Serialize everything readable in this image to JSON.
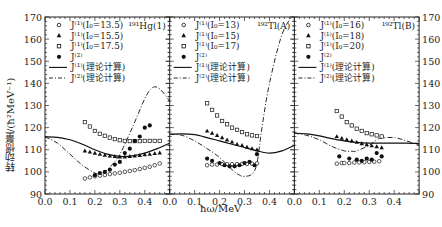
{
  "chart_data": {
    "type": "scatter",
    "ylabel": "转动惯量/(ħ²MeV⁻¹)",
    "xlabel": "ħω/MeV",
    "ylim": [
      90,
      170
    ],
    "yticks": [
      90,
      100,
      110,
      120,
      130,
      140,
      150,
      160,
      170
    ],
    "xlim": [
      0.0,
      0.5
    ],
    "xticks": [
      "0.0",
      "0.1",
      "0.2",
      "0.3",
      "0.4"
    ],
    "panels": [
      {
        "nucleus": "¹⁹¹Hg(1)",
        "legend": [
          "J⁽¹⁾(I₀=13.5)",
          "J⁽¹⁾(I₀=15.5)",
          "J⁽¹⁾(I₀=17.5)",
          "J⁽²⁾",
          "J⁽¹⁾(理论计算)",
          "J⁽²⁾(理论计算)"
        ],
        "series": [
          {
            "name": "J(1) I0=13.5",
            "marker": "open-circle",
            "x": [
              0.16,
              0.18,
              0.2,
              0.22,
              0.24,
              0.26,
              0.28,
              0.3,
              0.32,
              0.34,
              0.36,
              0.38,
              0.4,
              0.42,
              0.44,
              0.46
            ],
            "y": [
              97,
              97.5,
              98,
              98.3,
              98.6,
              99,
              99.3,
              99.6,
              100,
              100.4,
              100.8,
              101.3,
              101.8,
              102.3,
              103,
              103.8
            ]
          },
          {
            "name": "J(1) I0=15.5",
            "marker": "filled-triangle",
            "x": [
              0.16,
              0.18,
              0.2,
              0.22,
              0.24,
              0.26,
              0.28,
              0.3,
              0.32,
              0.34,
              0.36,
              0.38,
              0.4,
              0.42,
              0.44,
              0.46
            ],
            "y": [
              109.5,
              109,
              108.5,
              108,
              107.6,
              107.2,
              107,
              106.8,
              106.8,
              107,
              107.2,
              107.5,
              107.8,
              108,
              108.3,
              108.6
            ]
          },
          {
            "name": "J(1) I0=17.5",
            "marker": "open-square",
            "x": [
              0.16,
              0.18,
              0.2,
              0.22,
              0.24,
              0.26,
              0.28,
              0.3,
              0.32,
              0.34,
              0.36,
              0.38,
              0.4,
              0.42,
              0.44,
              0.46
            ],
            "y": [
              122.5,
              120.5,
              118.5,
              117.2,
              116.3,
              115.5,
              114.8,
              114.3,
              114,
              113.9,
              113.9,
              113.9,
              114,
              114,
              114,
              114
            ]
          },
          {
            "name": "J(2)",
            "marker": "filled-circle",
            "x": [
              0.2,
              0.22,
              0.24,
              0.26,
              0.28,
              0.3,
              0.32,
              0.34,
              0.36,
              0.38,
              0.4,
              0.42
            ],
            "y": [
              98.5,
              99.5,
              100,
              101,
              103.3,
              104.5,
              108.5,
              110.5,
              114,
              116,
              120,
              121
            ]
          }
        ],
        "theory_J1": {
          "x": [
            0.0,
            0.05,
            0.1,
            0.15,
            0.2,
            0.25,
            0.3,
            0.35,
            0.4,
            0.45,
            0.5
          ],
          "y": [
            115.8,
            115.6,
            114.5,
            112.5,
            110,
            108,
            107,
            107.2,
            108.5,
            110.5,
            113
          ]
        },
        "theory_J2": {
          "x": [
            0.0,
            0.05,
            0.1,
            0.15,
            0.2,
            0.22,
            0.25,
            0.3,
            0.35,
            0.4,
            0.43,
            0.46,
            0.5
          ],
          "y": [
            115.8,
            113,
            108,
            103,
            99.5,
            99.3,
            101,
            108,
            120,
            133,
            138,
            137.5,
            132
          ]
        }
      },
      {
        "nucleus": "¹⁹²Tl(A)",
        "legend": [
          "J⁽¹⁾(I₀=13)",
          "J⁽¹⁾(I₀=15)",
          "J⁽¹⁾(I₀=17)",
          "J⁽²⁾",
          "J⁽¹⁾(理论计算)",
          "J⁽²⁾(理论计算)"
        ],
        "series": [
          {
            "name": "J(1) I0=13",
            "marker": "open-circle",
            "x": [
              0.15,
              0.17,
              0.19,
              0.21,
              0.23,
              0.25,
              0.27,
              0.29,
              0.31,
              0.33,
              0.35
            ],
            "y": [
              103,
              103.3,
              103.3,
              103.5,
              103.5,
              103.5,
              103.5,
              103.6,
              103.6,
              103.7,
              103.8
            ]
          },
          {
            "name": "J(1) I0=15",
            "marker": "filled-triangle",
            "x": [
              0.15,
              0.17,
              0.19,
              0.21,
              0.23,
              0.25,
              0.27,
              0.29,
              0.31,
              0.33,
              0.35
            ],
            "y": [
              118.5,
              117.5,
              116.5,
              115.5,
              114.5,
              113.5,
              112.5,
              112,
              111.2,
              110.5,
              110
            ]
          },
          {
            "name": "J(1) I0=17",
            "marker": "open-square",
            "x": [
              0.15,
              0.17,
              0.19,
              0.21,
              0.23,
              0.25,
              0.27,
              0.29,
              0.31,
              0.33,
              0.35
            ],
            "y": [
              131,
              128,
              125.5,
              123,
              121.5,
              120,
              119,
              118,
              117,
              116.5,
              116.2
            ]
          },
          {
            "name": "J(2)",
            "marker": "filled-circle",
            "x": [
              0.15,
              0.17,
              0.2,
              0.22,
              0.24,
              0.26,
              0.28,
              0.3,
              0.32,
              0.34
            ],
            "y": [
              106,
              105,
              104,
              103,
              102.5,
              102.5,
              103,
              104,
              104.5,
              103
            ]
          },
          {
            "name": "J(2) b",
            "marker": "filled-circle",
            "x": [
              0.35
            ],
            "y": [
              108
            ]
          }
        ],
        "theory_J1": {
          "x": [
            0.0,
            0.05,
            0.1,
            0.15,
            0.2,
            0.25,
            0.3,
            0.35,
            0.4,
            0.45,
            0.5
          ],
          "y": [
            117,
            117.2,
            116.8,
            115.5,
            114,
            112.5,
            111,
            109.5,
            108.5,
            109.5,
            112
          ]
        },
        "theory_J2": {
          "x": [
            0.0,
            0.05,
            0.1,
            0.15,
            0.2,
            0.25,
            0.28,
            0.3,
            0.33,
            0.35,
            0.37,
            0.4,
            0.45,
            0.5
          ],
          "y": [
            117,
            116.5,
            114,
            110.5,
            106.5,
            101,
            98.5,
            98,
            99,
            104,
            120,
            140,
            162,
            172
          ]
        }
      },
      {
        "nucleus": "¹⁹²Tl(B)",
        "legend": [
          "J⁽¹⁾(I₀=16)",
          "J⁽¹⁾(I₀=18)",
          "J⁽¹⁾(I₀=20)",
          "J⁽²⁾",
          "J⁽¹⁾(理论计算)",
          "J⁽²⁾(理论计算)"
        ],
        "series": [
          {
            "name": "J(1) I0=16",
            "marker": "open-circle",
            "x": [
              0.17,
              0.19,
              0.2,
              0.22,
              0.24,
              0.26,
              0.28,
              0.3,
              0.32,
              0.34
            ],
            "y": [
              103.7,
              104,
              104,
              104,
              104.2,
              104.3,
              104.4,
              104.5,
              104.6,
              104.8
            ]
          },
          {
            "name": "J(1) I0=18",
            "marker": "filled-triangle",
            "x": [
              0.17,
              0.19,
              0.21,
              0.23,
              0.25,
              0.27,
              0.29,
              0.31,
              0.33,
              0.35
            ],
            "y": [
              116,
              115.2,
              114.6,
              114,
              113.4,
              112.8,
              112.3,
              111.8,
              111.4,
              111
            ]
          },
          {
            "name": "J(1) I0=20",
            "marker": "open-square",
            "x": [
              0.17,
              0.19,
              0.21,
              0.23,
              0.25,
              0.27,
              0.29,
              0.31,
              0.33,
              0.35
            ],
            "y": [
              127.5,
              125,
              122.5,
              121,
              119.5,
              118.5,
              117.5,
              117,
              116.5,
              116
            ]
          },
          {
            "name": "J(2)",
            "marker": "filled-circle",
            "x": [
              0.18,
              0.22,
              0.25,
              0.27,
              0.29,
              0.31,
              0.33,
              0.35
            ],
            "y": [
              107,
              106,
              105.5,
              105,
              106,
              105.5,
              108.5,
              107
            ]
          }
        ],
        "theory_J1": {
          "x": [
            0.0,
            0.05,
            0.1,
            0.15,
            0.2,
            0.25,
            0.3,
            0.35,
            0.4,
            0.45,
            0.5
          ],
          "y": [
            117.5,
            117.2,
            116.3,
            115,
            114,
            113.3,
            113,
            113,
            113,
            113,
            112.8
          ]
        },
        "theory_J2": {
          "x": [
            0.0,
            0.05,
            0.1,
            0.15,
            0.2,
            0.23,
            0.25,
            0.3,
            0.33,
            0.35,
            0.4,
            0.45,
            0.5
          ],
          "y": [
            117.5,
            116.5,
            114.5,
            111.5,
            109.5,
            109.3,
            109.5,
            112,
            114.5,
            115.3,
            115.5,
            114,
            112
          ]
        }
      }
    ]
  }
}
